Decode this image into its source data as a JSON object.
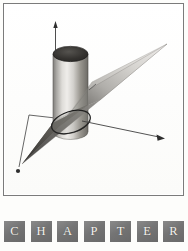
{
  "page": {
    "background_color": "#fdfdfb",
    "width": 188,
    "height": 251
  },
  "figure": {
    "frame_border_color": "#7b7b7b",
    "canvas_color": "#ffffff",
    "caption": "",
    "illustration_name": "plane-intersecting-cylinder",
    "elements": {
      "cylinder_label": "cylinder",
      "plane_label": "plane",
      "ellipse_label": "elliptical cross-section",
      "vertical_axis_label": "vertical-axis-arrow",
      "right_axis_label": "right-axis-arrow",
      "left_axis_label": "left-axis-arrow"
    },
    "colors": {
      "cylinder_light": "#e6e4e0",
      "cylinder_mid": "#b9b7b3",
      "cylinder_dark": "#6e6c69",
      "cylinder_top_dark": "#2f2e2d",
      "plane_light": "#d8d6d2",
      "plane_mid": "#a9a7a3",
      "plane_dark": "#5d5b58",
      "axis_line": "#4a4a4a",
      "ellipse_outline": "#1c1c1c"
    }
  },
  "chapter_strip": {
    "word": "CHAPTER",
    "tile_color": "#7a7a7a",
    "letter_color": "#f4f2ee",
    "letters": [
      {
        "char": "C"
      },
      {
        "char": "H"
      },
      {
        "char": "A"
      },
      {
        "char": "P"
      },
      {
        "char": "T"
      },
      {
        "char": "E"
      },
      {
        "char": "R"
      }
    ]
  }
}
